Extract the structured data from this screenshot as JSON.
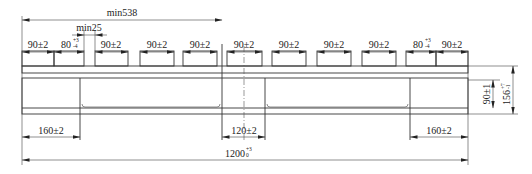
{
  "drawing": {
    "title": "Pallet side view dimension drawing",
    "overall_length": {
      "label": "1200",
      "tol_upper": "+3",
      "tol_lower": "0"
    },
    "min_span": {
      "label": "min538"
    },
    "min_gap": {
      "label": "min25"
    },
    "top_boards": [
      {
        "label": "90±2"
      },
      {
        "label": "80",
        "tol_upper": "+3",
        "tol_lower": "-4"
      },
      {
        "label": "90±2"
      },
      {
        "label": "90±2"
      },
      {
        "label": "90±2"
      },
      {
        "label": "90±2"
      },
      {
        "label": "90±2"
      },
      {
        "label": "90±2"
      },
      {
        "label": "90±2"
      },
      {
        "label": "80",
        "tol_upper": "+3",
        "tol_lower": "-4"
      },
      {
        "label": "90±2"
      }
    ],
    "bottom_dims": {
      "left_block": {
        "label": "160±2"
      },
      "center_block": {
        "label": "120±2"
      },
      "right_block": {
        "label": "160±2"
      }
    },
    "side_dims": {
      "inner_height": {
        "label": "90±1"
      },
      "total_height": {
        "label": "156",
        "tol_upper": "+7",
        "tol_lower": "-1"
      }
    }
  }
}
